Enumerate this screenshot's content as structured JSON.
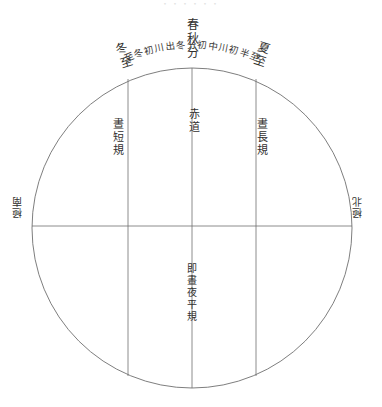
{
  "document": {
    "title": "天球晝夜長短規圖",
    "cropped_header": "・・・・・・",
    "medium": "scanned woodblock line drawing",
    "ink_color": "#31302e",
    "paper_color": "#ffffff"
  },
  "figure": {
    "shape": "circle",
    "center": {
      "x": 192,
      "y": 228
    },
    "radius": 160,
    "stroke_color": "#6f6f6f",
    "vertical_chords_x": [
      128,
      192,
      256
    ],
    "horizontal_diameter_y": 226
  },
  "labels": {
    "equinox": "春秋分",
    "winter_solstice": "冬至",
    "summer_solstice": "夏至",
    "short_day_circle": "晝短規",
    "equator": "赤道",
    "long_day_circle": "晝長規",
    "equal_day_night_circle": "即晝夜平規",
    "south_pole": "極南",
    "north_pole": "極北"
  },
  "arc_annotation": {
    "left_segment": "至冬初川出冬",
    "right_segment": "初中川初半至",
    "full_text": "至冬初川出冬分初中川初半至"
  }
}
